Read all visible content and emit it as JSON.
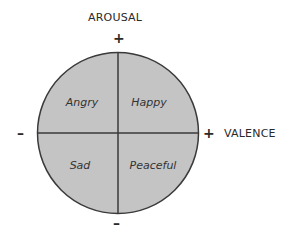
{
  "diagram": {
    "axes": {
      "vertical": {
        "label": "AROUSAL",
        "positive": "+",
        "negative": "–"
      },
      "horizontal": {
        "label": "VALENCE",
        "positive": "+",
        "negative": "–"
      }
    },
    "quadrants": [
      {
        "position": "top-left",
        "label": "Angry"
      },
      {
        "position": "top-right",
        "label": "Happy"
      },
      {
        "position": "bottom-left",
        "label": "Sad"
      },
      {
        "position": "bottom-right",
        "label": "Peaceful"
      }
    ],
    "colors": {
      "fill": "#c4c4c4",
      "stroke": "#3a3a3a",
      "text": "#2a2a2a"
    }
  }
}
